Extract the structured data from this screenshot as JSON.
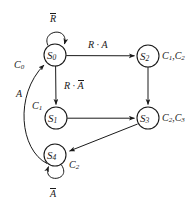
{
  "diagram": {
    "kind": "state-transition-diagram",
    "width": 194,
    "height": 209,
    "background_color": "#ffffff",
    "stroke_color": "#1a1a1a",
    "states": [
      {
        "id": "S0",
        "label_base": "S",
        "label_sub": "0",
        "cx": 55,
        "cy": 55,
        "r": 11,
        "output_label": "C0"
      },
      {
        "id": "S1",
        "label_base": "S",
        "label_sub": "1",
        "cx": 56,
        "cy": 118,
        "r": 11,
        "output_label": "C1"
      },
      {
        "id": "S2",
        "label_base": "S",
        "label_sub": "2",
        "cx": 148,
        "cy": 56,
        "r": 11,
        "output_label": "C1,C2"
      },
      {
        "id": "S3",
        "label_base": "S",
        "label_sub": "3",
        "cx": 148,
        "cy": 118,
        "r": 11,
        "output_label": "C2,C3"
      },
      {
        "id": "S4",
        "label_base": "S",
        "label_sub": "4",
        "cx": 55,
        "cy": 155,
        "r": 11,
        "output_label": "C2"
      }
    ],
    "outputs": [
      {
        "state": "S0",
        "base": "C",
        "sub": "0",
        "text": "C0"
      },
      {
        "state": "S1",
        "base": "C",
        "sub": "1",
        "text": "C1"
      },
      {
        "state": "S2",
        "parts": [
          {
            "base": "C",
            "sub": "1"
          },
          {
            "base": "C",
            "sub": "2"
          }
        ],
        "text": "C1,C2"
      },
      {
        "state": "S3",
        "parts": [
          {
            "base": "C",
            "sub": "2"
          },
          {
            "base": "C",
            "sub": "3"
          }
        ],
        "text": "C2,C3"
      },
      {
        "state": "S4",
        "base": "C",
        "sub": "2",
        "text": "C2"
      }
    ],
    "transitions": [
      {
        "from": "S0",
        "to": "S0",
        "type": "self-loop",
        "condition": "R̅",
        "condition_plain": "NOT R"
      },
      {
        "from": "S0",
        "to": "S2",
        "type": "straight",
        "condition": "R · A",
        "condition_plain": "R AND A"
      },
      {
        "from": "S0",
        "to": "S1",
        "type": "straight",
        "condition": "R · A̅",
        "condition_plain": "R AND NOT A"
      },
      {
        "from": "S2",
        "to": "S3",
        "type": "straight",
        "condition": "",
        "condition_plain": ""
      },
      {
        "from": "S1",
        "to": "S3",
        "type": "straight",
        "condition": "",
        "condition_plain": ""
      },
      {
        "from": "S3",
        "to": "S4",
        "type": "straight",
        "condition": "",
        "condition_plain": ""
      },
      {
        "from": "S4",
        "to": "S0",
        "type": "curve",
        "condition": "A",
        "condition_plain": "A"
      },
      {
        "from": "S4",
        "to": "S4",
        "type": "self-loop",
        "condition": "A̅",
        "condition_plain": "NOT A"
      }
    ],
    "edge_labels": [
      {
        "id": "loop-s0",
        "base": "R",
        "overbar": true,
        "x": 52,
        "y": 14,
        "text": "R"
      },
      {
        "id": "s0-s2",
        "text": "R · A",
        "x": 90,
        "y": 42
      },
      {
        "id": "s0-s1",
        "text": "R · A",
        "x": 66,
        "y": 82,
        "overbar_tail": true
      },
      {
        "id": "s4-s0",
        "text": "A",
        "x": 17,
        "y": 91
      },
      {
        "id": "loop-s4",
        "base": "A",
        "overbar": true,
        "x": 51,
        "y": 191,
        "text": "A"
      }
    ]
  }
}
